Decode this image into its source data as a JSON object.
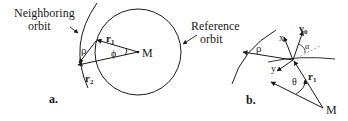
{
  "panel_a": {
    "caption": "a.",
    "neighboring_label_line1": "Neighboring",
    "neighboring_label_line2": "orbit",
    "reference_label_line1": "Reference",
    "reference_label_line2": "orbit",
    "r1": "r",
    "r1_sub": "1",
    "r2": "r",
    "r2_sub": "2",
    "rho": "ρ",
    "phi": "ϕ",
    "M": "M"
  },
  "panel_b": {
    "caption": "b.",
    "rho": "ρ",
    "x": "x",
    "y": "y",
    "v0": "v",
    "v0_sub": "0",
    "alpha": "α",
    "theta": "θ",
    "r1": "r",
    "r1_sub": "1",
    "M": "M"
  },
  "colors": {
    "ink": "#1a1a1a",
    "dashed": "#888888"
  }
}
